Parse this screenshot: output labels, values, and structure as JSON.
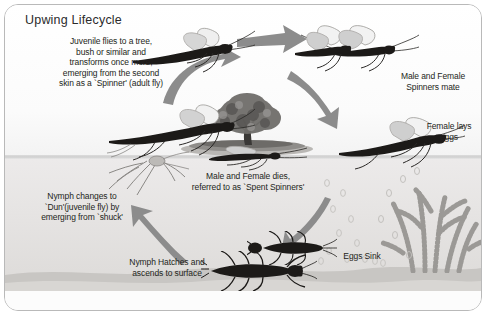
{
  "diagram": {
    "title": "Upwing Lifecycle",
    "watermark": "",
    "stages": [
      {
        "id": "juvenile",
        "label": "Juvenile flies to a tree,\nbush or similar and\ntransforms once more,\nemerging from the second\nskin as a `Spinner' (adult fly)"
      },
      {
        "id": "mate",
        "label": "Male and Female\nSpinners mate"
      },
      {
        "id": "lays-eggs",
        "label": "Female lays\neggs"
      },
      {
        "id": "spent-spinners",
        "label": "Male and Female dies,\nreferred to as `Spent Spinners'"
      },
      {
        "id": "eggs-sink",
        "label": "Eggs Sink"
      },
      {
        "id": "nymph-hatches",
        "label": "Nymph Hatches and\nascends to surface"
      },
      {
        "id": "nymph-dun",
        "label": "Nymph changes to\n`Dun'(juvenile fly) by\nemerging from `shuck'"
      }
    ],
    "colors": {
      "arrow": "#8c8c8c",
      "text": "#231f20",
      "water": "#e6e4e3",
      "sky": "#fbfbfb",
      "bed": "#c9c7c4",
      "frame": "#b9b9b9"
    }
  }
}
